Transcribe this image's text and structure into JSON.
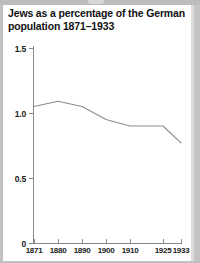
{
  "chart_data": {
    "type": "line",
    "title": "Jews as a percentage of the German population 1871–1933",
    "xlabel": "",
    "ylabel": "",
    "categories": [
      "1871",
      "1880",
      "1890",
      "1900",
      "1910",
      "1925",
      "1933"
    ],
    "x": [
      1871,
      1880,
      1890,
      1900,
      1910,
      1925,
      1933
    ],
    "values": [
      1.05,
      1.09,
      1.05,
      0.95,
      0.9,
      0.9,
      0.77
    ],
    "series": [
      {
        "name": "Jews as a percentage of the German population",
        "values": [
          1.05,
          1.09,
          1.05,
          0.95,
          0.9,
          0.9,
          0.77
        ]
      }
    ],
    "ytick_labels": [
      "1.5",
      "1.0",
      "0.5",
      "0"
    ],
    "ytick_values": [
      1.5,
      1.0,
      0.5,
      0
    ],
    "ylim": [
      0,
      1.5
    ],
    "xlim": [
      1871,
      1933
    ],
    "grid": false,
    "legend": false,
    "line_color": "#8c8c8c",
    "axis_color": "#8a8a8a",
    "background": "#ffffff",
    "page_background": "#c0c0c0"
  },
  "ticks": {
    "y": [
      {
        "label": "1.5",
        "top": 44
      },
      {
        "label": "1.0",
        "top": 109
      },
      {
        "label": "0.5",
        "top": 174
      },
      {
        "label": "0",
        "top": 239
      }
    ],
    "x": [
      {
        "label": "1871",
        "px": 34
      },
      {
        "label": "1880",
        "px": 58
      },
      {
        "label": "1890",
        "px": 82
      },
      {
        "label": "1900",
        "px": 106
      },
      {
        "label": "1910",
        "px": 130
      },
      {
        "label": "1925",
        "px": 163
      },
      {
        "label": "1933",
        "px": 181
      }
    ]
  },
  "polyline": "34,107 58,100 82,107 106,119 130,125 163,126 181,147"
}
